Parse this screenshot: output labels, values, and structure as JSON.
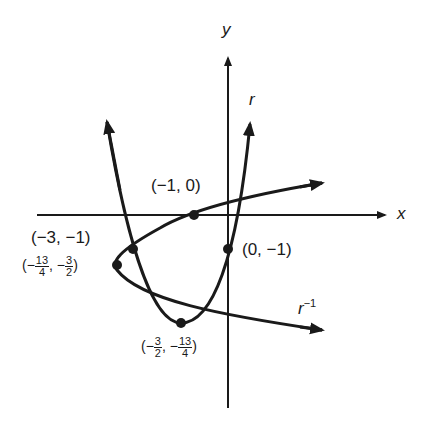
{
  "axes": {
    "x_label": "x",
    "y_label": "y"
  },
  "curves": [
    {
      "name": "r",
      "label": "r",
      "description": "parabola opening upward"
    },
    {
      "name": "r_inverse",
      "label": "r",
      "superscript": "−1",
      "description": "parabola opening rightward (inverse relation)"
    }
  ],
  "points": [
    {
      "id": "p1",
      "label": "(−1, 0)"
    },
    {
      "id": "p2",
      "label": "(0, −1)"
    },
    {
      "id": "p3",
      "label": "(−3, −1)"
    },
    {
      "id": "p4",
      "open": "(−",
      "frac1_num": "13",
      "frac1_den": "4",
      "sep": ", −",
      "frac2_num": "3",
      "frac2_den": "2",
      "close": ")"
    },
    {
      "id": "p5",
      "open": "(−",
      "frac1_num": "3",
      "frac1_den": "2",
      "sep": ", −",
      "frac2_num": "13",
      "frac2_den": "4",
      "close": ")"
    }
  ],
  "colors": {
    "ink": "#1a1a1a",
    "background": "#ffffff"
  }
}
